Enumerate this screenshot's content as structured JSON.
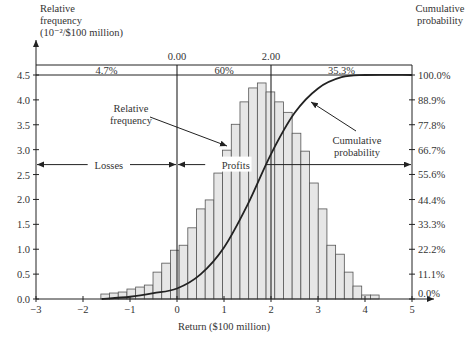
{
  "chart_data": {
    "type": "bar",
    "subtype": "histogram_with_cumulative_line",
    "title": "",
    "xlabel": "Return ($100 million)",
    "ylabel": "Relative frequency (10^-2/$100 million)",
    "ylabel_lines": [
      "Relative",
      "frequency",
      "(10⁻²/$100 million)"
    ],
    "y2label_lines": [
      "Cumulative",
      "probability"
    ],
    "xlim": [
      -3,
      5
    ],
    "ylim": [
      0,
      4.5
    ],
    "y2lim": [
      0,
      100
    ],
    "x_ticks": [
      -3,
      -2,
      -1,
      0,
      1,
      2,
      3,
      4,
      5
    ],
    "x_tick_labels": [
      "−3",
      "−2",
      "−1",
      "0",
      "1",
      "2",
      "3",
      "4",
      "5"
    ],
    "y_ticks": [
      0,
      0.5,
      1,
      1.5,
      2,
      2.5,
      3,
      3.5,
      4,
      4.5
    ],
    "y_tick_labels": [
      "0.0",
      "0.5",
      "1.0",
      "1.5",
      "2.0",
      "2.5",
      "3.0",
      "3.5",
      "4.0",
      "4.5"
    ],
    "y2_ticks": [
      0,
      11.1,
      22.2,
      33.3,
      44.4,
      55.6,
      66.7,
      77.8,
      88.9,
      100
    ],
    "y2_tick_labels": [
      "0.0%",
      "11.1%",
      "22.2%",
      "33.3%",
      "44.4%",
      "55.6%",
      "66.7%",
      "77.8%",
      "88.9%",
      "100.0%"
    ],
    "grid": false,
    "bins": {
      "start": -1.62,
      "width": 0.185,
      "values": [
        0.1,
        0.12,
        0.14,
        0.2,
        0.24,
        0.28,
        0.54,
        0.72,
        0.98,
        1.08,
        1.43,
        1.81,
        1.99,
        2.53,
        2.99,
        3.51,
        3.96,
        4.24,
        4.34,
        4.16,
        3.96,
        3.75,
        3.33,
        2.97,
        2.33,
        1.81,
        1.08,
        0.9,
        0.54,
        0.26,
        0.08,
        0.08
      ]
    },
    "cumulative_curve": {
      "x": [
        -1.6,
        -1.0,
        -0.5,
        0.0,
        0.5,
        1.0,
        1.5,
        2.0,
        2.5,
        3.0,
        3.5,
        4.0,
        5.0
      ],
      "y_percent": [
        0.0,
        1.0,
        2.6,
        4.7,
        11.0,
        23.0,
        42.0,
        64.7,
        83.0,
        94.0,
        99.0,
        100.0,
        100.0
      ]
    },
    "reference_lines": [
      {
        "x": 0.0,
        "label": "0.00"
      },
      {
        "x": 2.0,
        "label": "2.00"
      }
    ],
    "band_percentages": [
      {
        "range": [
          -3,
          0
        ],
        "label": "4.7%"
      },
      {
        "range": [
          0,
          2
        ],
        "label": "60%"
      },
      {
        "range": [
          2,
          5
        ],
        "label": "35.3%"
      }
    ],
    "annotations": [
      {
        "text": "Losses",
        "type": "double_arrow",
        "x_range": [
          -3,
          0
        ],
        "y": 2.7
      },
      {
        "text": "Profits",
        "type": "double_arrow",
        "x_range": [
          0,
          5
        ],
        "y": 2.7
      },
      {
        "text_lines": [
          "Relative",
          "frequency"
        ],
        "type": "arrow_label",
        "target": "histogram"
      },
      {
        "text_lines": [
          "Cumulative",
          "probability"
        ],
        "type": "arrow_label",
        "target": "cumulative_curve"
      }
    ],
    "colors": {
      "bar_fill": "#e6e6e6",
      "bar_stroke": "#555555",
      "line": "#222222",
      "text": "#333333"
    }
  }
}
